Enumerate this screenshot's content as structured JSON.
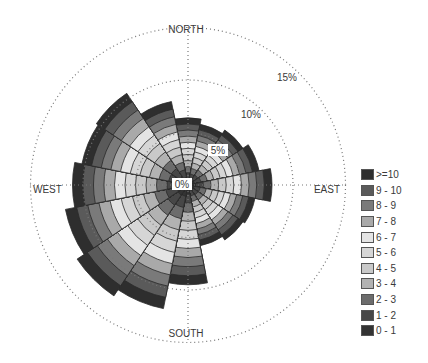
{
  "chart_data": {
    "type": "wind-rose",
    "title": "",
    "directions": [
      "N",
      "NNE",
      "NE",
      "ENE",
      "E",
      "ESE",
      "SE",
      "SSE",
      "S",
      "SSW",
      "SW",
      "WSW",
      "W",
      "WNW",
      "NW",
      "NNW"
    ],
    "compass_labels": {
      "north": "NORTH",
      "east": "EAST",
      "south": "SOUTH",
      "west": "WEST"
    },
    "radial_ticks": [
      {
        "value": 0,
        "label": "0%"
      },
      {
        "value": 5,
        "label": "5%"
      },
      {
        "value": 10,
        "label": "10%"
      },
      {
        "value": 15,
        "label": "15%"
      }
    ],
    "rlim": [
      0,
      15
    ],
    "grid": "dotted",
    "legend_position": "right",
    "bins": [
      ">=10",
      "9 - 10",
      "8 - 9",
      "7 - 8",
      "6 - 7",
      "5 - 6",
      "4 - 5",
      "3 - 4",
      "2 - 3",
      "1 - 2",
      "0 - 1"
    ],
    "bin_colors": [
      "#2e2e2e",
      "#5a5a5a",
      "#7a7a7a",
      "#a9a9a9",
      "#e4e4e4",
      "#d6d6d6",
      "#c9c9c9",
      "#b2b2b2",
      "#6c6c6c",
      "#474747",
      "#333333"
    ],
    "total_frequency_percent": {
      "N": 6.4,
      "NNE": 5.9,
      "NE": 6.3,
      "ENE": 6.9,
      "E": 8.0,
      "ESE": 6.5,
      "SE": 6.3,
      "SSE": 5.9,
      "S": 9.5,
      "SSW": 12.0,
      "SW": 12.7,
      "WSW": 11.9,
      "W": 11.0,
      "WNW": 10.3,
      "NW": 10.5,
      "NNW": 8.1
    }
  },
  "legend": {
    "items": [
      {
        "label": ">=10",
        "color": "#2e2e2e"
      },
      {
        "label": "9 - 10",
        "color": "#5a5a5a"
      },
      {
        "label": "8 - 9",
        "color": "#7a7a7a"
      },
      {
        "label": "7 - 8",
        "color": "#a9a9a9"
      },
      {
        "label": "6 - 7",
        "color": "#e4e4e4"
      },
      {
        "label": "5 - 6",
        "color": "#d6d6d6"
      },
      {
        "label": "4 - 5",
        "color": "#c9c9c9"
      },
      {
        "label": "3 - 4",
        "color": "#b2b2b2"
      },
      {
        "label": "2 - 3",
        "color": "#6c6c6c"
      },
      {
        "label": "1 - 2",
        "color": "#474747"
      },
      {
        "label": "0 - 1",
        "color": "#333333"
      }
    ]
  }
}
